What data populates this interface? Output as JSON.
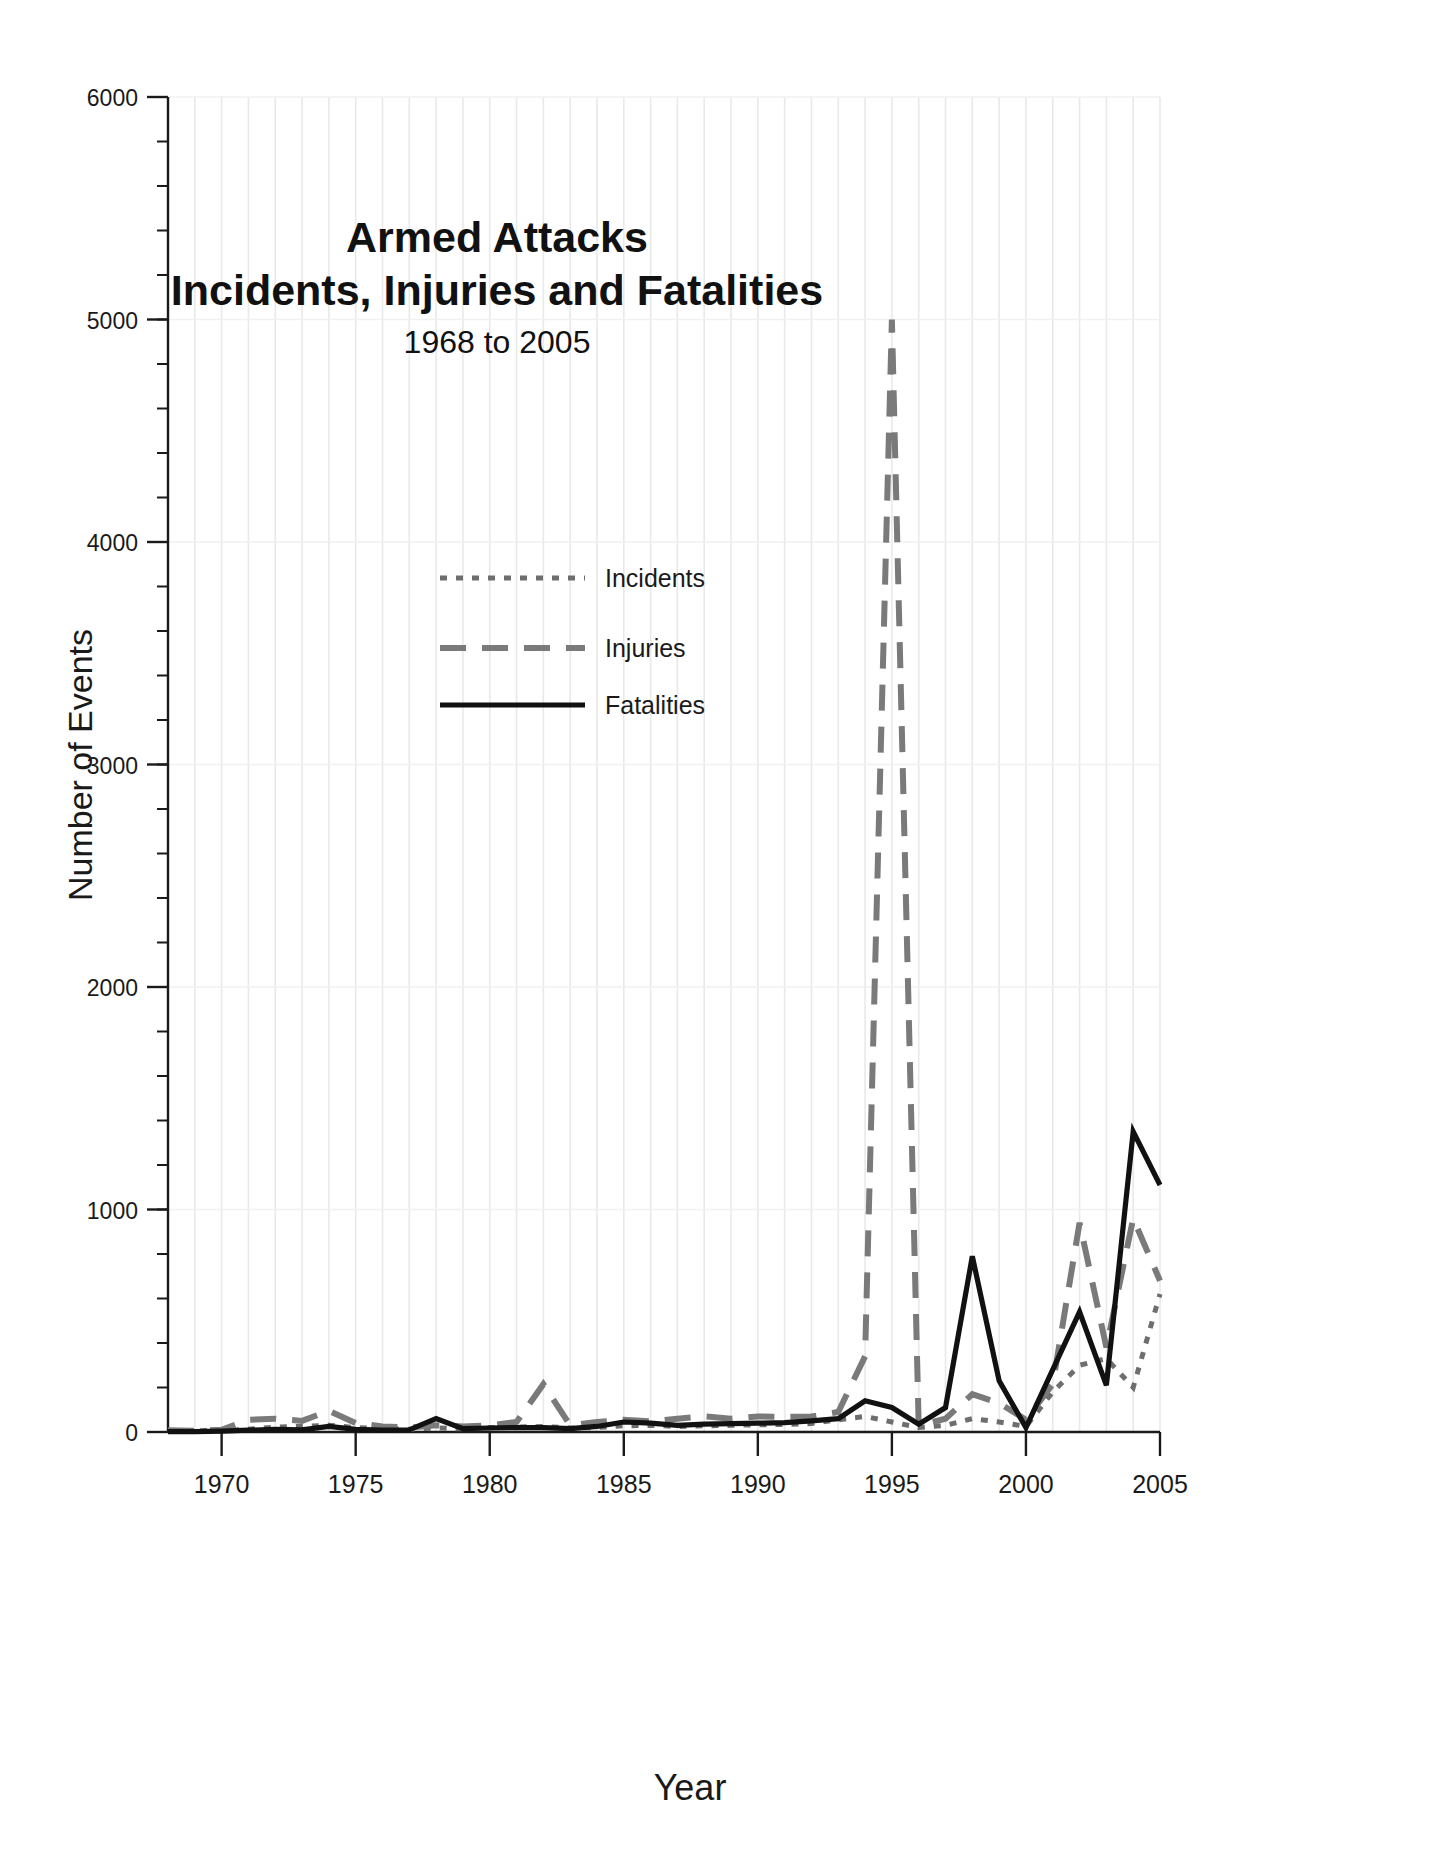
{
  "chart_data": {
    "type": "line",
    "title": "Armed Attacks",
    "title_line2": "Incidents, Injuries and Fatalities",
    "subtitle": "1968 to 2005",
    "xlabel": "Year",
    "ylabel": "Number of Events",
    "xlim": [
      1968,
      2005
    ],
    "ylim": [
      0,
      6000
    ],
    "ytick_labels": [
      "0",
      "1000",
      "2000",
      "3000",
      "4000",
      "5000",
      "6000"
    ],
    "ytick_values": [
      0,
      1000,
      2000,
      3000,
      4000,
      5000,
      6000
    ],
    "yminor_step": 200,
    "xtick_labels": [
      "1970",
      "1975",
      "1980",
      "1985",
      "1990",
      "1995",
      "2000",
      "2005"
    ],
    "xtick_values": [
      1970,
      1975,
      1980,
      1985,
      1990,
      1995,
      2000,
      2005
    ],
    "grid": "vertical-minor-and-horizontal-major",
    "legend_position": "upper-left-inside",
    "x": [
      1968,
      1969,
      1970,
      1971,
      1972,
      1973,
      1974,
      1975,
      1976,
      1977,
      1978,
      1979,
      1980,
      1981,
      1982,
      1983,
      1984,
      1985,
      1986,
      1987,
      1988,
      1989,
      1990,
      1991,
      1992,
      1993,
      1994,
      1995,
      1996,
      1997,
      1998,
      1999,
      2000,
      2001,
      2002,
      2003,
      2004,
      2005
    ],
    "series": [
      {
        "name": "Incidents",
        "style": "dotted",
        "color": "#6e6e6e",
        "values": [
          5,
          5,
          8,
          12,
          22,
          25,
          30,
          20,
          15,
          12,
          18,
          14,
          20,
          22,
          25,
          18,
          20,
          28,
          30,
          25,
          28,
          30,
          32,
          34,
          38,
          55,
          70,
          45,
          20,
          30,
          60,
          45,
          25,
          180,
          300,
          330,
          200,
          620
        ]
      },
      {
        "name": "Injuries",
        "style": "dashed",
        "color": "#7a7a7a",
        "values": [
          8,
          6,
          10,
          55,
          60,
          50,
          95,
          40,
          25,
          20,
          30,
          25,
          30,
          45,
          215,
          30,
          45,
          55,
          48,
          60,
          70,
          60,
          70,
          68,
          70,
          90,
          340,
          5000,
          30,
          60,
          170,
          130,
          55,
          215,
          940,
          380,
          960,
          680
        ]
      },
      {
        "name": "Fatalities",
        "style": "solid",
        "color": "#111111",
        "values": [
          2,
          2,
          4,
          8,
          12,
          10,
          25,
          12,
          8,
          10,
          60,
          15,
          18,
          20,
          20,
          15,
          25,
          45,
          40,
          30,
          35,
          38,
          40,
          42,
          50,
          60,
          140,
          110,
          35,
          110,
          790,
          230,
          20,
          280,
          540,
          210,
          1350,
          1110
        ]
      }
    ]
  },
  "legend": {
    "items": [
      {
        "label": "Incidents"
      },
      {
        "label": "Injuries"
      },
      {
        "label": "Fatalities"
      }
    ]
  },
  "colors": {
    "axis": "#1a1a1a",
    "grid_minor": "#e9e9e9",
    "grid_major": "#f1f1f1",
    "incidents": "#6e6e6e",
    "injuries": "#7a7a7a",
    "fatalities": "#111111",
    "text": "#1a1a1a",
    "background": "#ffffff"
  }
}
